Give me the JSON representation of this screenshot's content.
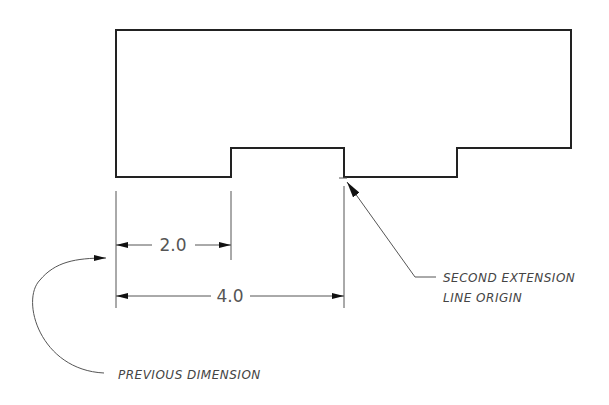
{
  "diagram": {
    "type": "baseline-dimensioning",
    "colors": {
      "outline": "#222222",
      "dimension": "#555555",
      "text": "#444444",
      "background": "#ffffff"
    },
    "dimensions": [
      {
        "id": "dim-2",
        "label": "2.0"
      },
      {
        "id": "dim-4",
        "label": "4.0"
      }
    ],
    "annotations": {
      "second_extension_line_1": "SECOND EXTENSION",
      "second_extension_line_2": "LINE ORIGIN",
      "previous_dimension": "PREVIOUS DIMENSION"
    }
  }
}
